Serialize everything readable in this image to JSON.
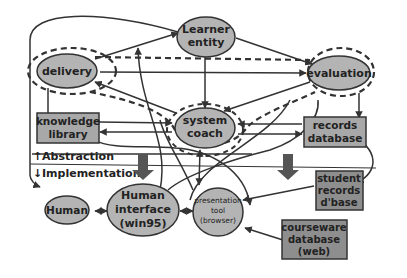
{
  "diagram": {
    "nodes": {
      "learner_entity": {
        "line1": "Learner",
        "line2": "entity",
        "shape": "ellipse"
      },
      "delivery": {
        "label": "delivery",
        "shape": "ellipse",
        "dashed_outline": true
      },
      "evaluation": {
        "label": "evaluation",
        "shape": "ellipse",
        "dashed_outline": true
      },
      "system_coach": {
        "line1": "system",
        "line2": "coach",
        "shape": "ellipse",
        "dashed_outline": true
      },
      "knowledge_library": {
        "line1": "knowledge",
        "line2": "library",
        "shape": "box"
      },
      "records_database": {
        "line1": "records",
        "line2": "database",
        "shape": "box"
      },
      "human": {
        "label": "Human",
        "shape": "ellipse"
      },
      "human_interface": {
        "line1": "Human",
        "line2": "interface",
        "line3": "(win95)",
        "shape": "ellipse"
      },
      "presentation_tool": {
        "line1": "presentation",
        "line2": "tool",
        "line3": "(browser)",
        "shape": "ellipse"
      },
      "student_records": {
        "line1": "student",
        "line2": "records",
        "line3": "d'base",
        "shape": "box"
      },
      "courseware_database": {
        "line1": "courseware",
        "line2": "database",
        "line3": "(web)",
        "shape": "box"
      }
    },
    "layers": {
      "abstraction": "Abstraction",
      "implementation": "Implementation",
      "up_arrow": "↑",
      "down_arrow": "↓"
    },
    "edges": [
      {
        "from": "delivery",
        "to": "learner_entity"
      },
      {
        "from": "learner_entity",
        "to": "evaluation"
      },
      {
        "from": "delivery",
        "to": "evaluation"
      },
      {
        "from": "learner_entity",
        "to": "system_coach"
      },
      {
        "from": "system_coach",
        "to": "delivery"
      },
      {
        "from": "evaluation",
        "to": "system_coach"
      },
      {
        "from": "knowledge_library",
        "to": "system_coach"
      },
      {
        "from": "system_coach",
        "to": "knowledge_library"
      },
      {
        "from": "records_database",
        "to": "system_coach"
      },
      {
        "from": "system_coach",
        "to": "records_database"
      },
      {
        "from": "evaluation",
        "to": "records_database"
      },
      {
        "from": "knowledge_library",
        "to": "delivery"
      },
      {
        "from": "human",
        "to": "human_interface",
        "bidirectional": true
      },
      {
        "from": "human_interface",
        "to": "presentation_tool",
        "bidirectional": true
      },
      {
        "from": "student_records",
        "to": "presentation_tool"
      },
      {
        "from": "courseware_database",
        "to": "presentation_tool"
      },
      {
        "from": "records_database",
        "to": "student_records",
        "bidirectional": true
      },
      {
        "from": "system_coach",
        "to": "presentation_tool",
        "bidirectional": true
      },
      {
        "from": "human_interface",
        "to": "learner_entity"
      },
      {
        "from": "learner_entity",
        "to": "human"
      }
    ],
    "colors": {
      "node_fill": "#b4b4b4",
      "box_fill": "#a8a8a8",
      "dark_box_fill": "#8e8e8e",
      "stroke": "#333333",
      "background": "#ffffff"
    }
  }
}
